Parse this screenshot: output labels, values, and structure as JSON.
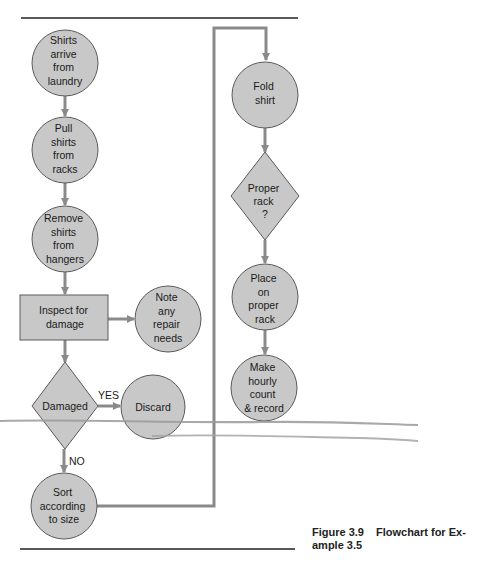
{
  "colors": {
    "node_fill": "#c8c8c8",
    "node_stroke": "#5a5a5a",
    "connector": "#8a8a8a",
    "rule": "#222222",
    "smudge": "#9a9a9a"
  },
  "nodes": {
    "shirts_arrive": {
      "shape": "circle",
      "lines": [
        "Shirts",
        "arrive",
        "from",
        "laundry"
      ]
    },
    "pull_shirts": {
      "shape": "circle",
      "lines": [
        "Pull",
        "shirts",
        "from",
        "racks"
      ]
    },
    "remove_shirts": {
      "shape": "circle",
      "lines": [
        "Remove",
        "shirts",
        "from",
        "hangers"
      ]
    },
    "inspect": {
      "shape": "rectangle",
      "lines": [
        "Inspect for",
        "damage"
      ]
    },
    "note_repair": {
      "shape": "circle",
      "lines": [
        "Note",
        "any",
        "repair",
        "needs"
      ]
    },
    "damaged": {
      "shape": "diamond",
      "lines": [
        "Damaged"
      ]
    },
    "discard": {
      "shape": "circle",
      "lines": [
        "Discard"
      ]
    },
    "sort": {
      "shape": "circle",
      "lines": [
        "Sort",
        "according",
        "to size"
      ]
    },
    "fold": {
      "shape": "circle",
      "lines": [
        "Fold",
        "shirt"
      ]
    },
    "proper_rack": {
      "shape": "diamond",
      "lines": [
        "Proper",
        "rack",
        "?"
      ]
    },
    "place": {
      "shape": "circle",
      "lines": [
        "Place",
        "on",
        "proper",
        "rack"
      ]
    },
    "hourly_count": {
      "shape": "circle",
      "lines": [
        "Make",
        "hourly",
        "count",
        "& record"
      ]
    }
  },
  "edge_labels": {
    "yes": "YES",
    "no": "NO"
  },
  "caption": {
    "number": "Figure 3.9",
    "title_line1": "Flowchart for Ex-",
    "title_line2": "ample 3.5"
  }
}
